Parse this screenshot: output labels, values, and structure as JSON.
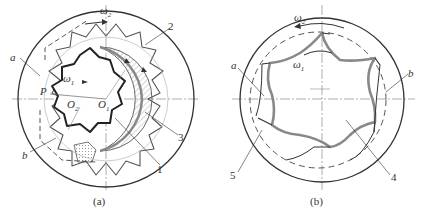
{
  "figure_a": {
    "caption": "(a)",
    "labels": {
      "omega2": "ω",
      "omega2_sub": "2",
      "omega1": "ω",
      "omega1_sub": "1",
      "a": "a",
      "b": "b",
      "P": "P",
      "O2": "O",
      "O2_sub": "2",
      "O1": "O",
      "O1_sub": "1",
      "n1": "1",
      "n2": "2",
      "n3": "3"
    }
  },
  "figure_b": {
    "caption": "(b)",
    "labels": {
      "omega2": "ω",
      "omega2_sub": "2",
      "omega1": "ω",
      "omega1_sub": "1",
      "a": "a",
      "b": "b",
      "n4": "4",
      "n5": "5"
    }
  },
  "colors": {
    "line": "#333333",
    "gray": "#888888",
    "background": "#ffffff"
  }
}
